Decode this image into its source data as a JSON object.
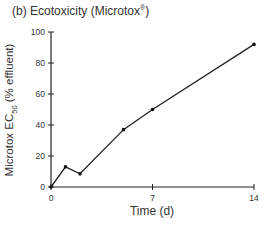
{
  "title": {
    "prefix": "(b) Ecotoxicity (Microtox",
    "sup": "®",
    "suffix": ")"
  },
  "y_axis": {
    "label_prefix": "Microtox EC",
    "label_sub": "50",
    "label_suffix": " (% effluent)"
  },
  "x_axis": {
    "label": "Time (d)"
  },
  "chart_data": {
    "type": "line",
    "title": "(b) Ecotoxicity (Microtox®)",
    "xlabel": "Time (d)",
    "ylabel": "Microtox EC50 (% effluent)",
    "x": [
      0,
      1,
      2,
      5,
      7,
      14
    ],
    "values": [
      0,
      13,
      8.5,
      37,
      50,
      92
    ],
    "series": [
      {
        "name": "Microtox EC50",
        "x": [
          0,
          1,
          2,
          5,
          7,
          14
        ],
        "values": [
          0,
          13,
          8.5,
          37,
          50,
          92
        ]
      }
    ],
    "xlim": [
      0,
      14
    ],
    "ylim": [
      0,
      100
    ],
    "xticks": [
      0,
      7,
      14
    ],
    "yticks": [
      0,
      20,
      40,
      60,
      80,
      100
    ],
    "grid": false,
    "legend": null,
    "colors": {
      "line": "#222222",
      "marker": "#111111",
      "axis": "#222222"
    }
  }
}
